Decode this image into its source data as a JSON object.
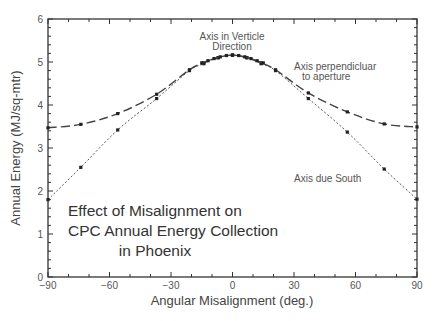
{
  "chart_data": {
    "type": "line",
    "title": "Effect of Misalignment on CPC Annual Energy Collection in Phoenix",
    "title_lines": [
      "Effect of Misalignment on",
      "CPC Annual Energy Collection",
      "in Phoenix"
    ],
    "xlabel": "Angular Misalignment (deg.)",
    "ylabel": "Annual Energy (MJ/sq-mtr)",
    "xlim": [
      -90,
      90
    ],
    "ylim": [
      0,
      6
    ],
    "xticks": [
      -90,
      -60,
      -30,
      0,
      30,
      60,
      90
    ],
    "yticks": [
      0,
      1,
      2,
      3,
      4,
      5,
      6
    ],
    "grid": false,
    "legend": "none (inline annotations)",
    "annotations": [
      {
        "text_lines": [
          "Axis in Verticle",
          "Direction"
        ],
        "x": 0,
        "y": 5.6
      },
      {
        "text_lines": [
          "Axis perpendicluar",
          "to aperture"
        ],
        "x": 45,
        "y": 5.0
      },
      {
        "text_lines": [
          "Axis due South"
        ],
        "x": 60,
        "y": 2.35
      }
    ],
    "series": [
      {
        "name": "Axis perpendicluar to aperture",
        "style": "dashed",
        "x": [
          -90,
          -74,
          -56,
          -37,
          -21,
          -14,
          -7,
          0,
          7,
          14,
          21,
          37,
          56,
          74,
          90
        ],
        "y": [
          3.47,
          3.55,
          3.8,
          4.25,
          4.82,
          4.98,
          5.1,
          5.16,
          5.1,
          4.98,
          4.82,
          4.28,
          3.84,
          3.56,
          3.49
        ]
      },
      {
        "name": "Axis due South",
        "style": "dotted",
        "x": [
          -90,
          -74,
          -56,
          -37,
          -21,
          -14,
          -7,
          0,
          7,
          14,
          21,
          37,
          56,
          74,
          90
        ],
        "y": [
          1.8,
          2.55,
          3.42,
          4.15,
          4.8,
          4.96,
          5.1,
          5.16,
          5.1,
          4.96,
          4.8,
          4.15,
          3.37,
          2.51,
          1.81
        ]
      },
      {
        "name": "Axis in Verticle Direction",
        "style": "solid-markers",
        "x": [
          -15,
          -12,
          -9,
          -6,
          -3,
          0,
          3,
          6,
          9,
          12,
          15
        ],
        "y": [
          4.98,
          5.03,
          5.08,
          5.12,
          5.15,
          5.16,
          5.15,
          5.12,
          5.08,
          5.03,
          4.98
        ]
      }
    ]
  },
  "colors": {
    "axis": "#333333",
    "line": "#444444",
    "text": "#555555"
  }
}
